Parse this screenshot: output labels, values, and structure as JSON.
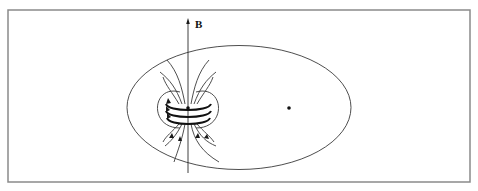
{
  "figure": {
    "axis_label": "B",
    "colors": {
      "frame": "#8a8a8a",
      "lines": "#2a2a2a",
      "background": "#ffffff"
    },
    "frame": {
      "x": 8,
      "y": 10,
      "width": 462,
      "height": 172
    },
    "ellipse": {
      "cx": 239,
      "cy": 107.5,
      "rx": 112,
      "ry": 62
    },
    "foci": [
      {
        "name": "left-focus",
        "x": 188,
        "y": 108
      },
      {
        "name": "right-focus",
        "x": 289,
        "y": 108
      }
    ],
    "b_axis": {
      "x": 188,
      "y_top": 20,
      "y_bottom": 173
    },
    "coil_loops": 3
  }
}
